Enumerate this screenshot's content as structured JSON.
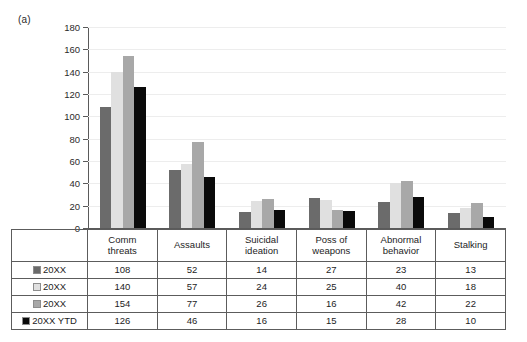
{
  "panel": {
    "label": "(a)"
  },
  "chart_data": {
    "type": "bar",
    "title": "",
    "xlabel": "",
    "ylabel": "",
    "ylim": [
      0,
      180
    ],
    "ytick_step": 20,
    "yticks": [
      180,
      160,
      140,
      120,
      100,
      80,
      60,
      40,
      20,
      0
    ],
    "grid": true,
    "legend_position": "table-left",
    "categories": [
      "Comm threats",
      "Assaults",
      "Suicidal ideation",
      "Poss of weapons",
      "Abnormal behavior",
      "Stalking"
    ],
    "series": [
      {
        "name": "20XX",
        "color": "#6b6b6b",
        "values": [
          108,
          52,
          14,
          27,
          23,
          13
        ]
      },
      {
        "name": "20XX",
        "color": "#e0e0e0",
        "values": [
          140,
          57,
          24,
          25,
          40,
          18
        ]
      },
      {
        "name": "20XX",
        "color": "#a8a8a8",
        "values": [
          154,
          77,
          26,
          16,
          42,
          22
        ]
      },
      {
        "name": "20XX YTD",
        "color": "#0a0a0a",
        "values": [
          126,
          46,
          16,
          15,
          28,
          10
        ]
      }
    ]
  },
  "table": {
    "header_row": [
      "Comm threats",
      "Assaults",
      "Suicidal ideation",
      "Poss of weapons",
      "Abnormal behavior",
      "Stalking"
    ],
    "header_lines": [
      [
        "Comm",
        "threats"
      ],
      [
        "Assaults",
        ""
      ],
      [
        "Suicidal",
        "ideation"
      ],
      [
        "Poss of",
        "weapons"
      ],
      [
        "Abnormal",
        "behavior"
      ],
      [
        "Stalking",
        ""
      ]
    ],
    "rows": [
      {
        "label": "20XX",
        "color": "#6b6b6b",
        "values": [
          "108",
          "52",
          "14",
          "27",
          "23",
          "13"
        ]
      },
      {
        "label": "20XX",
        "color": "#e0e0e0",
        "values": [
          "140",
          "57",
          "24",
          "25",
          "40",
          "18"
        ]
      },
      {
        "label": "20XX",
        "color": "#a8a8a8",
        "values": [
          "154",
          "77",
          "26",
          "16",
          "42",
          "22"
        ]
      },
      {
        "label": "20XX YTD",
        "color": "#0a0a0a",
        "values": [
          "126",
          "46",
          "16",
          "15",
          "28",
          "10"
        ]
      }
    ]
  },
  "colors": {
    "series_1": "#6b6b6b",
    "series_2": "#e0e0e0",
    "series_3": "#a8a8a8",
    "series_4": "#0a0a0a",
    "axis": "#5a5a5a",
    "grid": "#ededed",
    "table_border": "#5c5c5c"
  }
}
